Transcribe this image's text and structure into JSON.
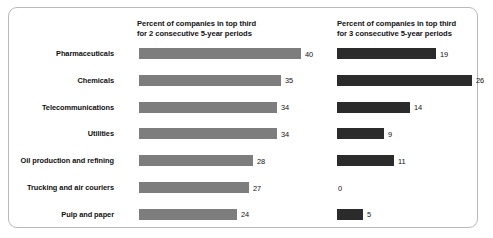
{
  "chart_data": {
    "type": "bar",
    "title": "",
    "subtitle": "",
    "xlabel": "",
    "ylabel": "",
    "grid": false,
    "legend_position": "column-headers",
    "orientation": "horizontal",
    "categories": [
      "Pharmaceuticals",
      "Chemicals",
      "Telecommunications",
      "Utilities",
      "Oil production and refining",
      "Trucking and air couriers",
      "Pulp and paper"
    ],
    "series": [
      {
        "name": "Percent of companies in top third for 2 consecutive 5-year periods",
        "color": "#7d7d7d",
        "values": [
          40,
          35,
          34,
          34,
          28,
          27,
          24
        ]
      },
      {
        "name": "Percent of companies in top third for 3 consecutive 5-year periods",
        "color": "#2b2b2b",
        "values": [
          19,
          26,
          14,
          9,
          11,
          0,
          5
        ]
      }
    ],
    "xlim": [
      0,
      40
    ],
    "value_labels_shown": true
  },
  "headers": {
    "left": "Percent of companies in top third\nfor 2 consecutive 5-year periods",
    "right": "Percent of companies in top third\nfor 3 consecutive 5-year periods"
  },
  "rows": [
    {
      "label": "Pharmaceuticals",
      "left_value": "40",
      "right_value": "19",
      "left_px": 162,
      "right_px": 99
    },
    {
      "label": "Chemicals",
      "left_value": "35",
      "right_value": "26",
      "left_px": 142,
      "right_px": 135
    },
    {
      "label": "Telecommunications",
      "left_value": "34",
      "right_value": "14",
      "left_px": 138,
      "right_px": 73
    },
    {
      "label": "Utilities",
      "left_value": "34",
      "right_value": "9",
      "left_px": 138,
      "right_px": 47
    },
    {
      "label": "Oil production and refining",
      "left_value": "28",
      "right_value": "11",
      "left_px": 114,
      "right_px": 57
    },
    {
      "label": "Trucking and air couriers",
      "left_value": "27",
      "right_value": "0",
      "left_px": 110,
      "right_px": 0
    },
    {
      "label": "Pulp and paper",
      "left_value": "24",
      "right_value": "5",
      "left_px": 98,
      "right_px": 26
    }
  ],
  "colors": {
    "bar_left": "#7d7d7d",
    "bar_right": "#2b2b2b",
    "frame_border": "#b9b9b9",
    "background": "#ffffff",
    "text": "#101010"
  }
}
